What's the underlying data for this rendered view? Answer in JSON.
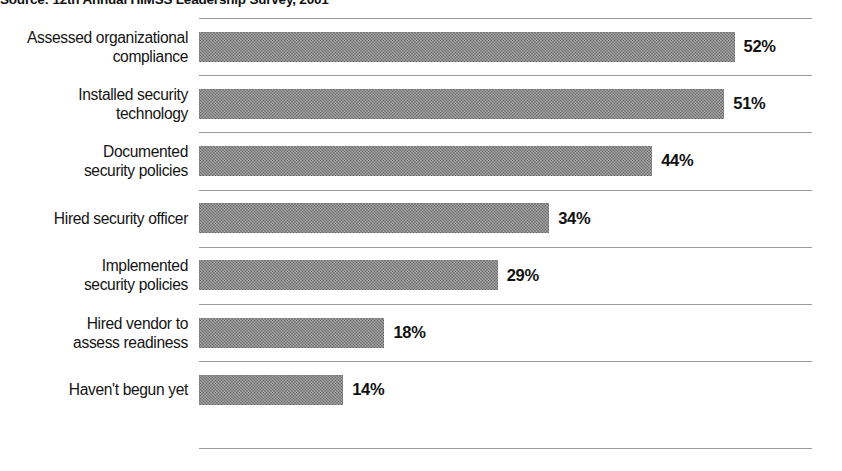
{
  "source_note": "Source: 12th Annual HIMSS Leadership Survey, 2001",
  "colors": {
    "bar_fill": "#7b7b7b",
    "gridline": "#9a9a9a",
    "text": "#141414",
    "background": "#ffffff"
  },
  "chart_data": {
    "type": "bar",
    "orientation": "horizontal",
    "title": "",
    "subtitle": "",
    "xlabel": "",
    "ylabel": "",
    "xlim": [
      0,
      60
    ],
    "grid": "horizontal-row-separators",
    "legend": "none",
    "value_label_format": "percent",
    "categories": [
      "Assessed organizational\ncompliance",
      "Installed security\ntechnology",
      "Documented\nsecurity policies",
      "Hired security officer",
      "Implemented\nsecurity policies",
      "Hired vendor to\nassess readiness",
      "Haven't begun yet"
    ],
    "values": [
      52,
      51,
      44,
      34,
      29,
      18,
      14
    ],
    "value_labels": [
      "52%",
      "51%",
      "44%",
      "34%",
      "29%",
      "18%",
      "14%"
    ],
    "annotations": [
      "Source: 12th Annual HIMSS Leadership Survey, 2001"
    ]
  }
}
